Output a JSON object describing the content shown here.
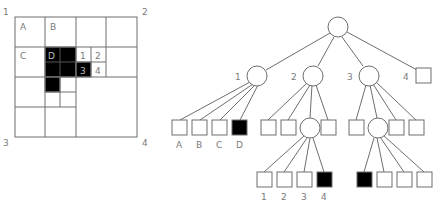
{
  "quadtree_grid": {
    "corner_labels": [
      "1",
      "2",
      "3",
      "4"
    ],
    "cell_labels": [
      "A",
      "B",
      "C",
      "D",
      "1",
      "2",
      "3",
      "4"
    ],
    "filled_color": "#000000",
    "empty_color": "#ffffff"
  },
  "tree": {
    "root": {
      "shape": "circle",
      "label": ""
    },
    "level1": [
      {
        "label": "1",
        "shape": "circle"
      },
      {
        "label": "2",
        "shape": "circle"
      },
      {
        "label": "3",
        "shape": "circle"
      },
      {
        "label": "4",
        "shape": "square",
        "filled": false
      }
    ],
    "level2_node1_children": [
      {
        "label": "A",
        "shape": "square",
        "filled": false
      },
      {
        "label": "B",
        "shape": "square",
        "filled": false
      },
      {
        "label": "C",
        "shape": "square",
        "filled": false
      },
      {
        "label": "D",
        "shape": "square",
        "filled": true
      }
    ],
    "level2_node2_children": [
      {
        "shape": "square",
        "filled": false
      },
      {
        "shape": "square",
        "filled": false
      },
      {
        "shape": "circle"
      },
      {
        "shape": "square",
        "filled": false
      }
    ],
    "level2_node3_children": [
      {
        "shape": "square",
        "filled": false
      },
      {
        "shape": "circle"
      },
      {
        "shape": "square",
        "filled": false
      },
      {
        "shape": "square",
        "filled": false
      }
    ],
    "level3_from_node2": [
      {
        "label": "1",
        "shape": "square",
        "filled": false
      },
      {
        "label": "2",
        "shape": "square",
        "filled": false
      },
      {
        "label": "3",
        "shape": "square",
        "filled": false
      },
      {
        "label": "4",
        "shape": "square",
        "filled": true
      }
    ],
    "level3_from_node3": [
      {
        "shape": "square",
        "filled": true
      },
      {
        "shape": "square",
        "filled": false
      },
      {
        "shape": "square",
        "filled": false
      },
      {
        "shape": "square",
        "filled": false
      }
    ]
  }
}
